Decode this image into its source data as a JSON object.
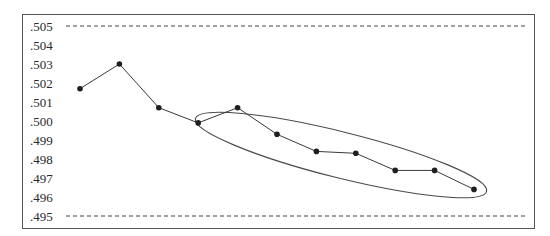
{
  "chart_data": {
    "type": "line",
    "title": "",
    "xlabel": "",
    "ylabel": "",
    "ylim": [
      0.495,
      0.505
    ],
    "y_ticks": [
      ".505",
      ".504",
      ".503",
      ".502",
      ".501",
      ".500",
      ".499",
      ".498",
      ".497",
      ".496",
      ".495"
    ],
    "x": [
      1,
      2,
      3,
      4,
      5,
      6,
      7,
      8,
      9,
      10,
      11
    ],
    "series": [
      {
        "name": "measurements",
        "values": [
          0.5017,
          0.503,
          0.5007,
          0.4999,
          0.5007,
          0.4993,
          0.4984,
          0.4983,
          0.4974,
          0.4974,
          0.4964
        ]
      }
    ],
    "reference_lines": [
      {
        "name": "upper-limit",
        "value": 0.505,
        "style": "dashed"
      },
      {
        "name": "lower-limit",
        "value": 0.495,
        "style": "dashed"
      }
    ],
    "annotations": [
      {
        "type": "ellipse",
        "description": "encircles points 4 through 11 (downward trend)",
        "points": [
          4,
          11
        ]
      }
    ],
    "grid": false,
    "legend": "none"
  },
  "colors": {
    "line": "#3a3a3a",
    "marker": "#1e1e1e",
    "frame": "#555555",
    "text": "#2a2a2a"
  }
}
